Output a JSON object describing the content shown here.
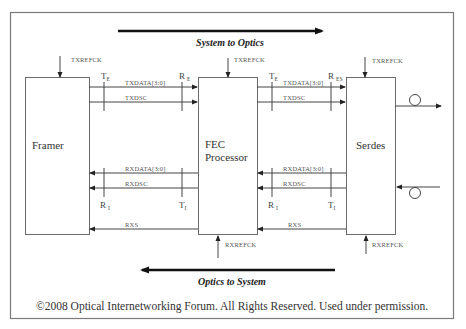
{
  "diagram": {
    "directions": {
      "top": "System to Optics",
      "bottom": "Optics to System"
    },
    "blocks": {
      "framer": "Framer",
      "fec_line1": "FEC",
      "fec_line2": "Processor",
      "serdes": "Serdes"
    },
    "clocks": {
      "framer_tx": "TXREFCK",
      "fec_tx": "TXREFCK",
      "serdes_tx": "TXREFCK",
      "fec_rx": "RXREFCK",
      "serdes_rx": "RXREFCK"
    },
    "signals": {
      "left_txdata": "TXDATA[3:0]",
      "left_txdsc": "TXDSC",
      "left_rxdata": "RXDATA[3:0]",
      "left_rxdsc": "RXDSC",
      "left_rxs": "RXS",
      "right_txdata": "TXDATA[3:0]",
      "right_txdsc": "TXDSC",
      "right_rxdata": "RXDATA[3:0]",
      "right_rxdsc": "RXDSC",
      "right_rxs": "RXS"
    },
    "test_points": {
      "left_tx_t": "T",
      "left_tx_t_sub": "E",
      "left_tx_r": "R",
      "left_tx_r_sub": "E",
      "right_tx_t": "T",
      "right_tx_t_sub": "E",
      "right_tx_r": "R",
      "right_tx_r_sub": "ES",
      "left_rx_r": "R",
      "left_rx_r_sub": "I",
      "left_rx_t": "T",
      "left_rx_t_sub": "I",
      "right_rx_r": "R",
      "right_rx_r_sub": "I",
      "right_rx_t": "T",
      "right_rx_t_sub": "I"
    },
    "copyright": "©2008 Optical Internetworking Forum. All Rights Reserved. Used under permission."
  }
}
